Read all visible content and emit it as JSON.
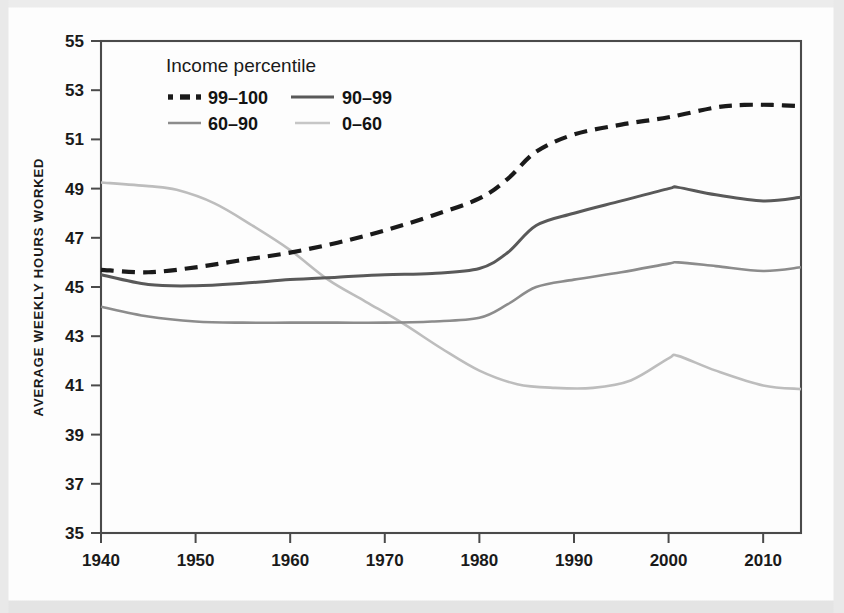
{
  "chart_data": {
    "type": "line",
    "title": "",
    "xlabel": "",
    "ylabel": "AVERAGE WEEKLY HOURS WORKED",
    "xlim": [
      1940,
      2014
    ],
    "ylim": [
      35,
      55
    ],
    "grid": false,
    "legend_position": "top-left-inside",
    "legend_title": "Income percentile",
    "xticks": [
      1940,
      1950,
      1960,
      1970,
      1980,
      1990,
      2000,
      2010
    ],
    "xtick_labels": [
      "1940",
      "1950",
      "1960",
      "1970",
      "1980",
      "1990",
      "2000",
      "2010"
    ],
    "yticks": [
      35,
      37,
      39,
      41,
      43,
      45,
      47,
      49,
      51,
      53,
      55
    ],
    "ytick_labels": [
      "35",
      "37",
      "39",
      "41",
      "43",
      "45",
      "47",
      "49",
      "51",
      "53",
      "55"
    ],
    "series": [
      {
        "name": "99–100",
        "style": "dashed",
        "color": "#1a1a1a",
        "width": 4.2,
        "x": [
          1940,
          1945,
          1950,
          1955,
          1960,
          1965,
          1970,
          1975,
          1980,
          1983,
          1986,
          1990,
          1995,
          2000,
          2005,
          2008,
          2011,
          2014
        ],
        "y": [
          45.7,
          45.6,
          45.8,
          46.1,
          46.4,
          46.8,
          47.3,
          47.9,
          48.6,
          49.4,
          50.5,
          51.2,
          51.6,
          51.9,
          52.3,
          52.4,
          52.4,
          52.35
        ]
      },
      {
        "name": "90–99",
        "style": "solid",
        "color": "#595959",
        "width": 3.0,
        "x": [
          1940,
          1945,
          1950,
          1955,
          1960,
          1965,
          1970,
          1975,
          1980,
          1983,
          1986,
          1990,
          1995,
          2000,
          2001,
          2005,
          2010,
          2014
        ],
        "y": [
          45.5,
          45.1,
          45.05,
          45.15,
          45.3,
          45.4,
          45.5,
          45.55,
          45.75,
          46.4,
          47.5,
          48.0,
          48.5,
          49.0,
          49.05,
          48.75,
          48.5,
          48.65
        ]
      },
      {
        "name": "60–90",
        "style": "solid",
        "color": "#8c8c8c",
        "width": 2.6,
        "x": [
          1940,
          1945,
          1950,
          1955,
          1960,
          1965,
          1970,
          1975,
          1980,
          1983,
          1986,
          1990,
          1995,
          2000,
          2001,
          2005,
          2010,
          2014
        ],
        "y": [
          44.2,
          43.8,
          43.6,
          43.55,
          43.55,
          43.55,
          43.55,
          43.6,
          43.75,
          44.3,
          45.0,
          45.3,
          45.6,
          45.95,
          46.0,
          45.85,
          45.65,
          45.8
        ]
      },
      {
        "name": "0–60",
        "style": "solid",
        "color": "#bdbdbd",
        "width": 2.6,
        "x": [
          1940,
          1945,
          1948,
          1952,
          1956,
          1960,
          1964,
          1968,
          1972,
          1976,
          1980,
          1984,
          1988,
          1992,
          1996,
          2000,
          2001,
          2005,
          2010,
          2014
        ],
        "y": [
          49.25,
          49.1,
          48.95,
          48.4,
          47.5,
          46.5,
          45.3,
          44.4,
          43.5,
          42.5,
          41.6,
          41.05,
          40.9,
          40.9,
          41.2,
          42.1,
          42.2,
          41.6,
          41.0,
          40.85
        ]
      }
    ]
  },
  "legend": {
    "title": "Income percentile",
    "entries": [
      {
        "label": "99–100",
        "swatch": "dashed-black"
      },
      {
        "label": "90–99",
        "swatch": "solid-dark-gray"
      },
      {
        "label": "60–90",
        "swatch": "solid-medium-gray"
      },
      {
        "label": "0–60",
        "swatch": "solid-light-gray"
      }
    ]
  },
  "colors": {
    "series_99_100": "#1a1a1a",
    "series_90_99": "#595959",
    "series_60_90": "#8c8c8c",
    "series_0_60": "#bdbdbd",
    "axis": "#4a4a4a",
    "text": "#1a1a1a",
    "background": "#fdfdfd"
  }
}
